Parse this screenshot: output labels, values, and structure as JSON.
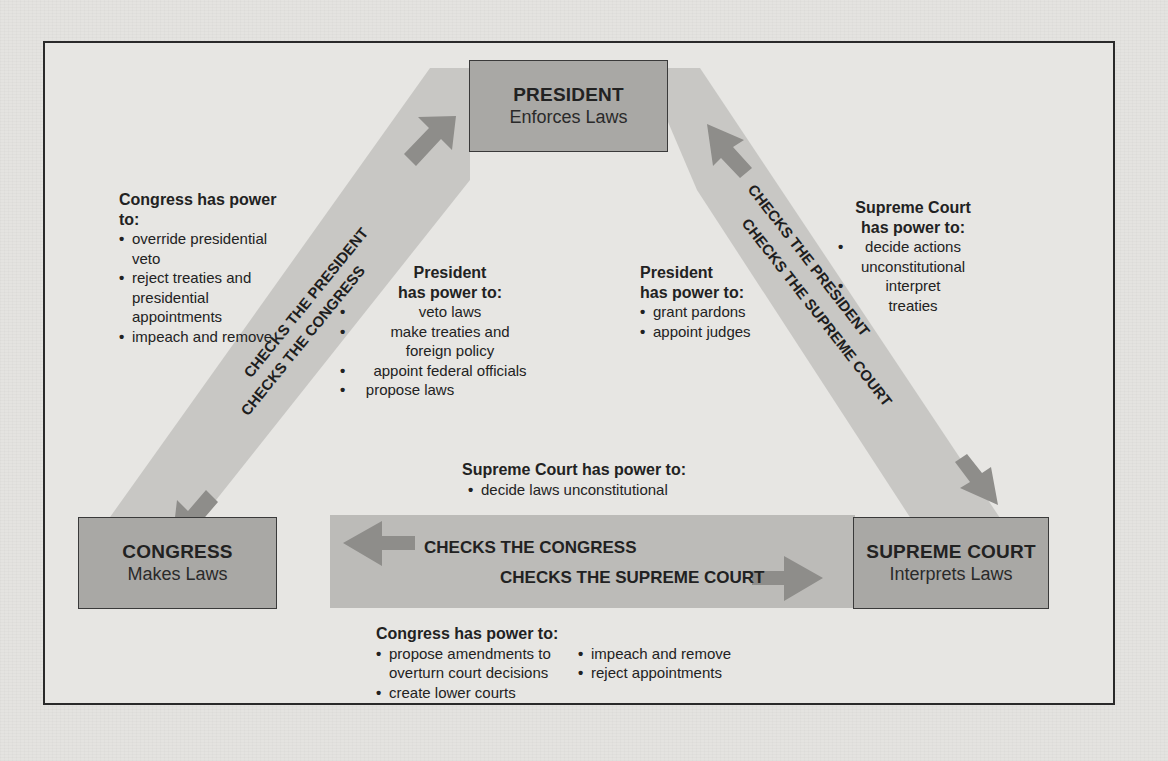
{
  "colors": {
    "page_bg": "#e4e3e0",
    "frame_border": "#2a2a2a",
    "band_fill": "#c8c7c4",
    "box_fill": "#a9a8a5",
    "arrow_fill": "#8e8d8a"
  },
  "branches": {
    "president": {
      "title": "PRESIDENT",
      "subtitle": "Enforces Laws"
    },
    "congress": {
      "title": "CONGRESS",
      "subtitle": "Makes Laws"
    },
    "supreme_court": {
      "title": "SUPREME COURT",
      "subtitle": "Interprets Laws"
    }
  },
  "bands": {
    "left": {
      "upper_label": "CHECKS THE PRESIDENT",
      "lower_label": "CHECKS THE CONGRESS"
    },
    "right": {
      "upper_label": "CHECKS THE PRESIDENT",
      "lower_label": "CHECKS THE SUPREME COURT"
    },
    "bottom": {
      "upper_label": "CHECKS THE CONGRESS",
      "lower_label": "CHECKS THE SUPREME COURT"
    }
  },
  "powers": {
    "congress_over_president": {
      "heading": "Congress has power to:",
      "items": [
        "override presidential veto",
        "reject treaties and presidential appointments",
        "impeach and remove"
      ]
    },
    "president_over_congress": {
      "heading_line1": "President",
      "heading_line2": "has power to:",
      "items": [
        "veto laws",
        "make treaties and foreign policy",
        "appoint federal officials",
        "propose laws"
      ]
    },
    "president_over_court": {
      "heading_line1": "President",
      "heading_line2": "has power to:",
      "items": [
        "grant pardons",
        "appoint judges"
      ]
    },
    "court_over_president": {
      "heading_line1": "Supreme Court",
      "heading_line2": "has power to:",
      "items": [
        "decide actions unconstitutional",
        "interpret treaties"
      ]
    },
    "court_over_congress": {
      "heading": "Supreme Court has power to:",
      "items": [
        "decide laws unconstitutional"
      ]
    },
    "congress_over_court": {
      "heading": "Congress has power to:",
      "items_col1": [
        "propose amendments to overturn court decisions",
        "create lower courts"
      ],
      "items_col2": [
        "impeach and remove",
        "reject appointments"
      ]
    }
  }
}
